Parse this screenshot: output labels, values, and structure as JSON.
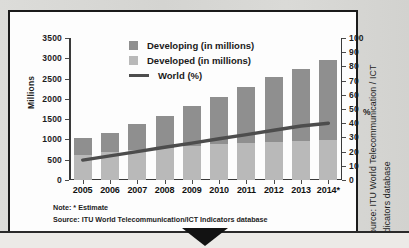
{
  "chart_data": {
    "type": "bar",
    "title": "",
    "subtitle": "",
    "xlabel": "",
    "ylabel": "Millions",
    "y2label": "%",
    "categories": [
      "2005",
      "2006",
      "2007",
      "2008",
      "2009",
      "2010",
      "2011",
      "2012",
      "2013",
      "2014*"
    ],
    "ylim": [
      0,
      3500
    ],
    "y2lim": [
      0,
      100
    ],
    "yticks": [
      0,
      500,
      1000,
      1500,
      2000,
      2500,
      3000,
      3500
    ],
    "y2ticks": [
      0,
      10,
      20,
      30,
      40,
      50,
      60,
      70,
      80,
      90,
      100
    ],
    "grid": false,
    "legend_position": "top-center",
    "stacked": true,
    "series": [
      {
        "name": "Developed (in millions)",
        "type": "bar",
        "axis": "left",
        "color": "#b9b9b9",
        "values": [
          620,
          680,
          740,
          800,
          850,
          890,
          920,
          940,
          960,
          975
        ]
      },
      {
        "name": "Developing (in millions)",
        "type": "bar",
        "axis": "left",
        "color": "#8f8f8f",
        "values": [
          410,
          490,
          650,
          770,
          970,
          1150,
          1380,
          1600,
          1770,
          1975
        ]
      },
      {
        "name": "World (%)",
        "type": "line",
        "axis": "right",
        "color": "#4d4d4d",
        "values": [
          14,
          17,
          20,
          23,
          26,
          29,
          32,
          35,
          38,
          40
        ]
      }
    ],
    "totals": [
      1030,
      1170,
      1390,
      1570,
      1820,
      2040,
      2300,
      2540,
      2730,
      2950
    ]
  },
  "legend": {
    "items": [
      {
        "label": "Developing (in millions)",
        "marker": "square",
        "color": "#8f8f8f"
      },
      {
        "label": "Developed (in millions)",
        "marker": "square",
        "color": "#b9b9b9"
      },
      {
        "label": "World (%)",
        "marker": "line",
        "color": "#4d4d4d"
      }
    ]
  },
  "axes": {
    "left_title": "Millions",
    "right_title": "%",
    "left_ticks": [
      "3500",
      "3000",
      "2500",
      "2000",
      "1500",
      "1000",
      "500",
      "0"
    ],
    "right_ticks": [
      "100",
      "90",
      "80",
      "70",
      "60",
      "50",
      "40",
      "30",
      "20",
      "10",
      "0"
    ],
    "x_ticks": [
      "2005",
      "2006",
      "2007",
      "2008",
      "2009",
      "2010",
      "2011",
      "2012",
      "2013",
      "2014*"
    ]
  },
  "footnotes": {
    "note": "Note: * Estimate",
    "source": "Source: ITU World Telecommunication/ICT Indicators database"
  },
  "side_source": {
    "line1": "Source: ITU World Telecommunication / ICT",
    "line2": "Indicators database"
  },
  "colors": {
    "developing": "#8f8f8f",
    "developed": "#b9b9b9",
    "world_line": "#4d4d4d",
    "panel_border": "#1b1b1b",
    "page_background": "#d9d9d6"
  }
}
